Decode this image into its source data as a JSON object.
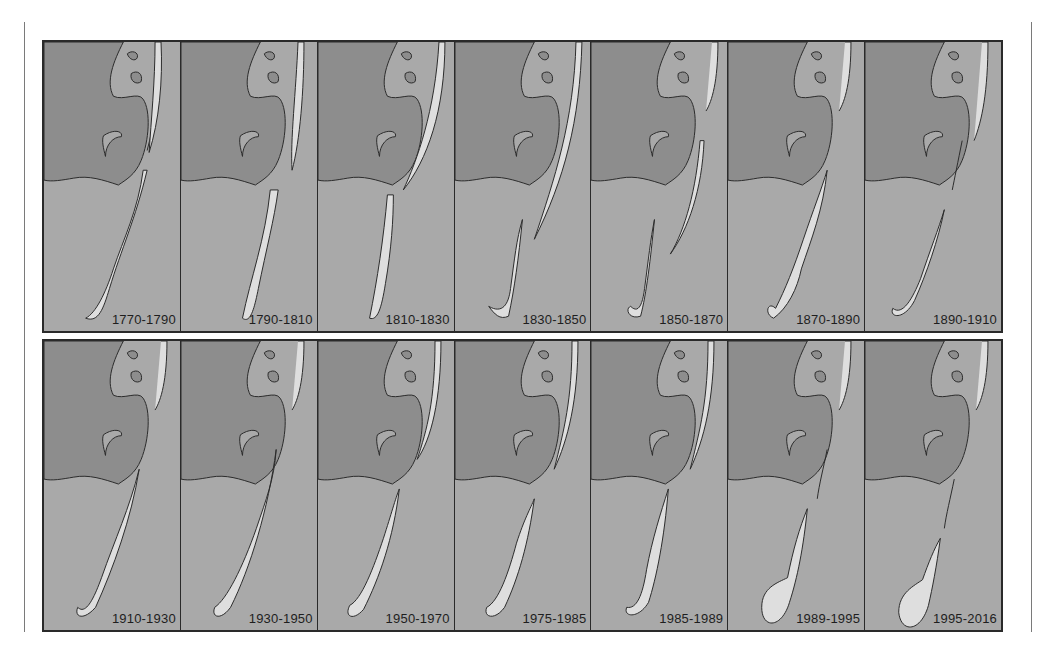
{
  "figure": {
    "type": "map-sequence",
    "colors": {
      "mainland": "#8d8d8d",
      "water": "#a9a9a9",
      "sandbar": "#dedede",
      "outline": "#2b2b2b"
    },
    "rows": [
      {
        "panels": [
          {
            "label": "1770-1790"
          },
          {
            "label": "1790-1810"
          },
          {
            "label": "1810-1830"
          },
          {
            "label": "1830-1850"
          },
          {
            "label": "1850-1870"
          },
          {
            "label": "1870-1890"
          },
          {
            "label": "1890-1910"
          }
        ]
      },
      {
        "panels": [
          {
            "label": "1910-1930"
          },
          {
            "label": "1930-1950"
          },
          {
            "label": "1950-1970"
          },
          {
            "label": "1975-1985"
          },
          {
            "label": "1985-1989"
          },
          {
            "label": "1989-1995"
          },
          {
            "label": "1995-2016"
          }
        ]
      }
    ]
  }
}
